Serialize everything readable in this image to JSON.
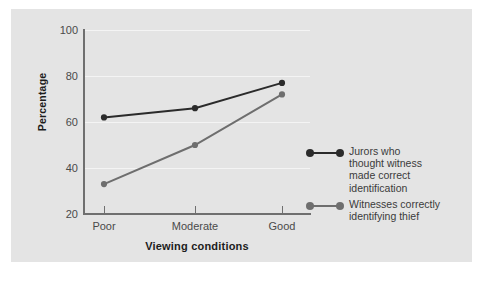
{
  "chart_data": {
    "type": "line",
    "title": "",
    "xlabel": "Viewing conditions",
    "ylabel": "Percentage",
    "categories": [
      "Poor",
      "Moderate",
      "Good"
    ],
    "ylim": [
      20,
      100
    ],
    "yticks": [
      20,
      40,
      60,
      80,
      100
    ],
    "ytick_labels": [
      "20",
      "40",
      "60",
      "80",
      "100"
    ],
    "grid": true,
    "grid_axis": "y",
    "grid_color": "#f4f4f4",
    "legend_position": "right",
    "series": [
      {
        "name": "Jurors who\nthought witness\nmade correct\nidentification",
        "color": "#2b2b2b",
        "values": [
          62,
          66,
          77
        ]
      },
      {
        "name": "Witnesses correctly\nidentifying thief",
        "color": "#6e6e6e",
        "values": [
          33,
          50,
          72
        ]
      }
    ]
  },
  "figure": {
    "panel_color": "#e4e4e4",
    "background_color": "#ffffff",
    "axis_color": "#6f6f6f",
    "tick_label_color": "#4a4a4a",
    "axis_title_color": "#1c1c1c"
  },
  "legend": {
    "items": [
      {
        "label": "Jurors who\nthought witness\nmade correct\nidentification",
        "color": "#2b2b2b"
      },
      {
        "label": "Witnesses correctly\nidentifying thief",
        "color": "#6e6e6e"
      }
    ]
  }
}
